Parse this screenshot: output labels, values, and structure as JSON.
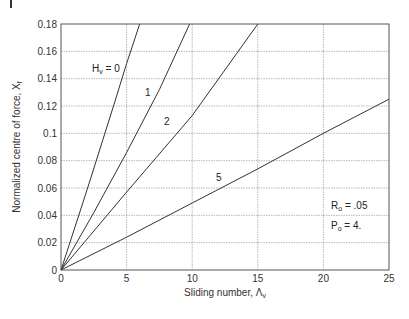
{
  "chart_data": {
    "type": "line",
    "title": "",
    "xlabel": "Sliding number, Λv",
    "ylabel": "Normalized centre of force, Xf",
    "xlim": [
      0,
      25
    ],
    "ylim": [
      0,
      0.18
    ],
    "grid": true,
    "x_ticks": [
      0,
      5,
      10,
      15,
      20,
      25
    ],
    "x_tick_labels": [
      "0",
      "5",
      "10",
      "15",
      "20",
      "25"
    ],
    "y_ticks": [
      0,
      0.02,
      0.04,
      0.06,
      0.08,
      0.1,
      0.12,
      0.14,
      0.16,
      0.18
    ],
    "y_tick_labels": [
      "0",
      "0.02",
      "0.04",
      "0.06",
      "0.08",
      "0.1",
      "0.12",
      "0.14",
      "0.16",
      "0.18"
    ],
    "series": [
      {
        "name": "Hv = 0",
        "label": "Hv = 0",
        "x": [
          0,
          2,
          4,
          5,
          6.0
        ],
        "y": [
          0,
          0.059,
          0.12,
          0.151,
          0.18
        ],
        "label_pos": [
          3.0,
          0.145
        ]
      },
      {
        "name": "Hv = 1",
        "label": "1",
        "x": [
          0,
          2.5,
          5,
          7.5,
          9.8
        ],
        "y": [
          0,
          0.042,
          0.086,
          0.132,
          0.18
        ],
        "label_pos": [
          4.5,
          0.112
        ]
      },
      {
        "name": "Hv = 2",
        "label": "2",
        "x": [
          0,
          5,
          10,
          15
        ],
        "y": [
          0,
          0.057,
          0.113,
          0.18
        ],
        "label_pos": [
          6.3,
          0.092
        ]
      },
      {
        "name": "Hv = 5",
        "label": "5",
        "x": [
          0,
          5,
          10,
          15,
          20,
          25
        ],
        "y": [
          0,
          0.024,
          0.049,
          0.074,
          0.1,
          0.125
        ],
        "label_pos": [
          10.5,
          0.069
        ]
      }
    ],
    "annotations": [
      {
        "text_main": "R",
        "text_sub": "o",
        "text_rest": " = .05",
        "pos": [
          20.7,
          0.037
        ]
      },
      {
        "text_main": "P",
        "text_sub": "o",
        "text_rest": " = 4.",
        "pos": [
          20.7,
          0.024
        ]
      }
    ]
  },
  "labels": {
    "xlabel_main": "Sliding number, Λ",
    "xlabel_sub": "v",
    "ylabel_main": "Normalized centre of force, X",
    "ylabel_sub": "f",
    "h0_main": "H",
    "h0_sub": "v",
    "h0_rest": " = 0",
    "r0_main": "R",
    "r0_sub": "o",
    "r0_rest": " = .05",
    "p0_main": "P",
    "p0_sub": "o",
    "p0_rest": " = 4."
  }
}
